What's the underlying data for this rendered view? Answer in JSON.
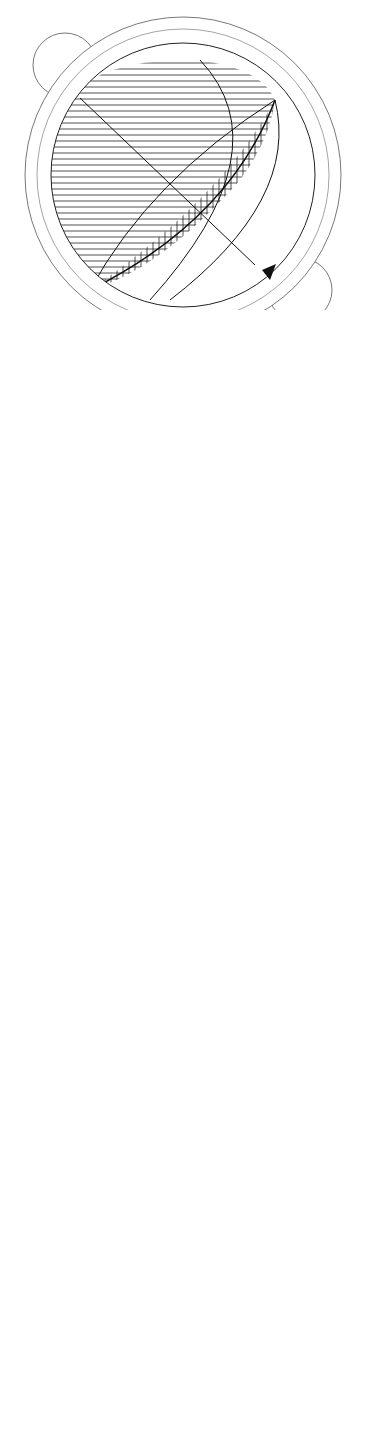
{
  "figures": [
    {
      "id": "3.12",
      "caption": {
        "line1": "Bild",
        "line2": "3.12"
      },
      "type": "sun-path-diagram",
      "latitude_label": "LAT 51° N",
      "compass": {
        "n": "N",
        "ne": "NE",
        "e": "E",
        "s": "S",
        "sw": "SW",
        "w": "W",
        "nw": "NW"
      },
      "tab_label": {
        "line1": "SONNE SOLEIL",
        "line2": "SUN"
      },
      "months": [
        "MAI/JUL",
        "APR/AUG",
        "MAR/SEP",
        "FEB/OKT",
        "JAN/NOV",
        "DEZ"
      ]
    },
    {
      "id": "3.13",
      "caption": {
        "line1": "Bild",
        "line2": "3.13"
      },
      "type": "shading-section"
    },
    {
      "id": "3.14",
      "caption": {
        "line1": "Bild",
        "line2": "3.14"
      },
      "type": "hemisphere",
      "zenith_label": "ZENIT",
      "horizon_label": "HORIZONT"
    },
    {
      "id": "3.15",
      "caption": {
        "line1": "Bild",
        "line2": "3.15"
      },
      "type": "sun-path-diagram",
      "latitude_label": "LAT 51° N",
      "compass": {
        "n": "N",
        "ne": "NE",
        "e": "E",
        "s": "S",
        "sw": "SW",
        "w": "W",
        "nw": "NW"
      },
      "tab_label": {
        "line1": "SONNE SOLEIL",
        "line2": "SUN"
      }
    },
    {
      "id": "3.16",
      "caption": {
        "line1": "Bild",
        "line2": "3.16"
      },
      "type": "sun-path-diagram",
      "latitude_label": "LAT 51° N",
      "compass": {
        "n": "N",
        "ne": "NE",
        "e": "E",
        "s": "S",
        "sw": "SW",
        "w": "W",
        "nw": "NW"
      },
      "tab_label": {
        "line1": "SONNE SOLEIL",
        "line2": "SUN"
      },
      "hour_labels": [
        "19",
        "18",
        "17",
        "16",
        "15",
        "14",
        "13",
        "12",
        "11",
        "10",
        "9",
        "8",
        "7",
        "6",
        "5"
      ],
      "solstice_label": "JUN"
    }
  ]
}
